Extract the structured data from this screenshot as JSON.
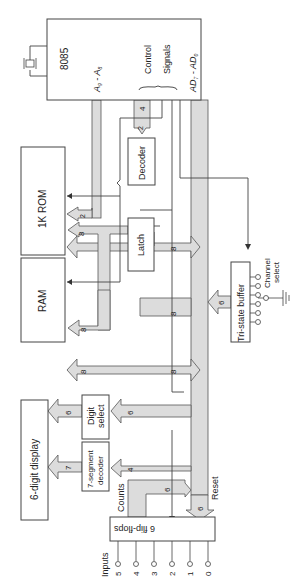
{
  "diagram": {
    "blocks": {
      "cpu": "8085",
      "addr_bus_label": "A",
      "addr_sub_hi": "9",
      "addr_sep": " - ",
      "addr_sub_lo": "8",
      "control": "Control",
      "signals": "Signals",
      "data_bus_label": "AD",
      "data_sub_hi": "7",
      "data_sep": " - AD",
      "data_sub_lo": "0",
      "decoder": "Decoder",
      "rom": "1K ROM",
      "latch": "Latch",
      "ram": "RAM",
      "tristate": "Tri-state buffer",
      "channel_select_1": "Channel",
      "channel_select_2": "select",
      "display": "6-digit display",
      "digit_select_1": "Digit",
      "digit_select_2": "select",
      "seg_decoder_1": "7-segment",
      "seg_decoder_2": "decoder",
      "flipflops": "6 flip-flops",
      "counts": "Counts",
      "reset": "Reset",
      "inputs": "Inputs"
    },
    "bus_widths": {
      "cpu_to_decoder": "4",
      "decoder_in": "2",
      "addr_to_rom": "2",
      "data_to_rom": "8",
      "latch_to_rom": "8",
      "data_to_latch": "8",
      "latch_to_ram": "8",
      "data_to_ram": "8",
      "tristate_to_bus": "6",
      "bus_to_digit_select": "6",
      "digit_select_to_display": "6",
      "bus_to_seg_decoder": "4",
      "seg_decoder_to_display": "7",
      "counts_to_bus": "6",
      "bus_to_flipflops": "6"
    },
    "inputs": [
      "5",
      "4",
      "3",
      "2",
      "1",
      "0"
    ]
  }
}
